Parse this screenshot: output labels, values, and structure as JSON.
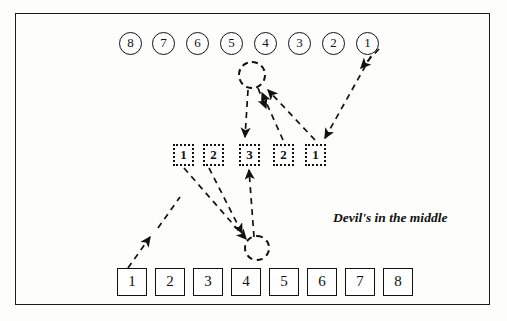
{
  "figure": {
    "caption": "Devil's in the middle",
    "caption_x": 333,
    "caption_y": 210,
    "frame": {
      "x": 15,
      "y": 13,
      "width": 475,
      "height": 292,
      "color": "#1a1a1a"
    },
    "ink_color": "#111111",
    "background": "#fdfdfc"
  },
  "top_row": {
    "name": "circled-number-row",
    "items": [
      {
        "label": "8",
        "x": 119,
        "y": 32
      },
      {
        "label": "7",
        "x": 152,
        "y": 32
      },
      {
        "label": "6",
        "x": 186,
        "y": 32
      },
      {
        "label": "5",
        "x": 220,
        "y": 32
      },
      {
        "label": "4",
        "x": 254,
        "y": 32
      },
      {
        "label": "3",
        "x": 288,
        "y": 32
      },
      {
        "label": "2",
        "x": 322,
        "y": 32
      },
      {
        "label": "1",
        "x": 356,
        "y": 32
      }
    ]
  },
  "middle_row": {
    "name": "dashed-square-row",
    "items": [
      {
        "label": "1",
        "x": 173,
        "y": 144
      },
      {
        "label": "2",
        "x": 203,
        "y": 144
      },
      {
        "label": "3",
        "x": 239,
        "y": 144
      },
      {
        "label": "2",
        "x": 273,
        "y": 144
      },
      {
        "label": "1",
        "x": 305,
        "y": 144
      }
    ]
  },
  "bottom_row": {
    "name": "solid-square-row",
    "items": [
      {
        "label": "1",
        "x": 117,
        "y": 268
      },
      {
        "label": "2",
        "x": 155,
        "y": 268
      },
      {
        "label": "3",
        "x": 193,
        "y": 268
      },
      {
        "label": "4",
        "x": 231,
        "y": 268
      },
      {
        "label": "5",
        "x": 269,
        "y": 268
      },
      {
        "label": "6",
        "x": 307,
        "y": 268
      },
      {
        "label": "7",
        "x": 345,
        "y": 268
      },
      {
        "label": "8",
        "x": 383,
        "y": 268
      }
    ]
  },
  "dashed_circles": [
    {
      "name": "top-empty-slot",
      "cx": 252,
      "cy": 75,
      "r": 14
    },
    {
      "name": "bottom-empty-slot",
      "cx": 257,
      "cy": 248,
      "r": 13
    }
  ],
  "arrows": [
    {
      "name": "arrow-circle1-to-mid1",
      "x1": 372,
      "y1": 48,
      "x2": 322,
      "y2": 140
    },
    {
      "name": "arrow-circle1-head-upper",
      "x1": 377,
      "y1": 47,
      "x2": 357,
      "y2": 68
    },
    {
      "name": "arrow-mid1-to-topslot",
      "x1": 318,
      "y1": 140,
      "x2": 264,
      "y2": 88
    },
    {
      "name": "arrow-mid2-to-topslot",
      "x1": 285,
      "y1": 140,
      "x2": 262,
      "y2": 90
    },
    {
      "name": "arrow-topslot-to-mid3",
      "x1": 250,
      "y1": 90,
      "x2": 247,
      "y2": 138
    },
    {
      "name": "arrow-topslot-down-short",
      "x1": 258,
      "y1": 88,
      "x2": 266,
      "y2": 110
    },
    {
      "name": "arrow-mid1-to-bottomslot",
      "x1": 183,
      "y1": 168,
      "x2": 247,
      "y2": 240
    },
    {
      "name": "arrow-mid2-to-bottomslot",
      "x1": 207,
      "y1": 168,
      "x2": 245,
      "y2": 238
    },
    {
      "name": "arrow-bottomslot-to-mid3",
      "x1": 253,
      "y1": 238,
      "x2": 248,
      "y2": 170
    },
    {
      "name": "arrow-bottombox1-up",
      "x1": 131,
      "y1": 266,
      "x2": 152,
      "y2": 236
    },
    {
      "name": "arrow-bottombox1-trail",
      "x1": 155,
      "y1": 232,
      "x2": 178,
      "y2": 200
    }
  ]
}
